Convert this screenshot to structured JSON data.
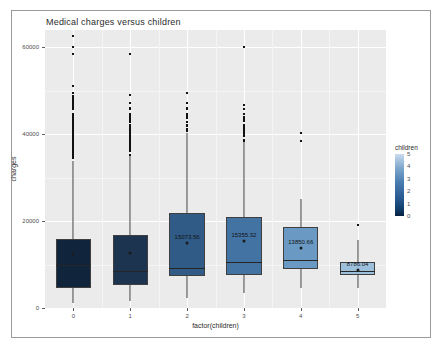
{
  "chart_data": {
    "type": "box",
    "title": "Medical charges versus children",
    "xlabel": "factor(children)",
    "ylabel": "charges",
    "categories": [
      "0",
      "1",
      "2",
      "3",
      "4",
      "5"
    ],
    "ylim": [
      0,
      64000
    ],
    "yticks": [
      "0",
      "20000",
      "40000",
      "60000"
    ],
    "ytick_values": [
      0,
      20000,
      40000,
      60000
    ],
    "grid": true,
    "legend": {
      "title": "children",
      "type": "colorbar",
      "position": "right",
      "ticks": [
        "0",
        "1",
        "2",
        "3",
        "4",
        "5"
      ],
      "tick_values": [
        0,
        1,
        2,
        3,
        4,
        5
      ],
      "low_color": "#06203f",
      "high_color": "#c9dced"
    },
    "boxes": [
      {
        "category": "0",
        "fill": "#10243c",
        "lower_whisker": 1121,
        "q1": 4600,
        "median": 9856,
        "q3": 16000,
        "upper_whisker": 33900,
        "mean": 12366,
        "label": "",
        "label_shown": false
      },
      {
        "category": "1",
        "fill": "#1c3450",
        "lower_whisker": 1711,
        "q1": 5400,
        "median": 8483,
        "q3": 16800,
        "upper_whisker": 35100,
        "mean": 12731,
        "label": "",
        "label_shown": false
      },
      {
        "category": "2",
        "fill": "#2f5b86",
        "lower_whisker": 2300,
        "q1": 7400,
        "median": 9264,
        "q3": 21900,
        "upper_whisker": 40200,
        "mean": 15073.56,
        "label": "15073.56",
        "label_shown": true
      },
      {
        "category": "3",
        "fill": "#4273a3",
        "lower_whisker": 3400,
        "q1": 7500,
        "median": 10601,
        "q3": 21000,
        "upper_whisker": 38300,
        "mean": 15355.32,
        "label": "15355.32",
        "label_shown": true
      },
      {
        "category": "4",
        "fill": "#6a9ac4",
        "lower_whisker": 4500,
        "q1": 8900,
        "median": 11034,
        "q3": 18600,
        "upper_whisker": 25200,
        "mean": 13850.66,
        "label": "13850.66",
        "label_shown": true
      },
      {
        "category": "5",
        "fill": "#9cc0dc",
        "lower_whisker": 4688,
        "q1": 7700,
        "median": 8589,
        "q3": 10600,
        "upper_whisker": 15700,
        "mean": 8786.04,
        "label": "8786.04",
        "label_shown": true
      }
    ],
    "outliers": {
      "0": [
        62592,
        60021,
        58571,
        51194,
        49577,
        48885,
        48549,
        48173,
        47928,
        47496,
        47291,
        47055,
        46889,
        46718,
        46661,
        46255,
        46200,
        45863,
        45710,
        45702,
        44585,
        44501,
        43943,
        43921,
        43813,
        43578,
        43254,
        42983,
        42856,
        42760,
        42303,
        42124,
        41999,
        41949,
        41919,
        41661,
        41097,
        40974,
        40904,
        40720,
        40419,
        40182,
        40003,
        39983,
        39774,
        39727,
        39611,
        39556,
        39241,
        38998,
        38746,
        38511,
        38282,
        38126,
        37829,
        37742,
        37701,
        37484,
        37165,
        36950,
        36910,
        36837,
        36580,
        36307,
        36085,
        35595,
        35491,
        35160,
        34806,
        34672,
        34439
      ],
      "1": [
        58571,
        48970,
        47291,
        46151,
        45863,
        45702,
        44641,
        44423,
        43943,
        43753,
        43578,
        43254,
        42983,
        42856,
        42112,
        41676,
        41097,
        40941,
        40720,
        40419,
        40182,
        39727,
        39611,
        39047,
        38746,
        38511,
        38282,
        37829,
        37701,
        37484,
        37165,
        36950,
        36580,
        36219,
        35147
      ],
      "2": [
        49577,
        47305,
        46151,
        45863,
        44641,
        44423,
        43943,
        43753,
        42856,
        42112,
        41949,
        41097,
        40720
      ],
      "3": [
        60021,
        46661,
        45863,
        44641,
        43943,
        43578,
        42983,
        42112,
        41919,
        41661,
        41097,
        40941,
        40720,
        40419,
        40182,
        39983,
        39727,
        39556,
        38746,
        38511
      ],
      "4": [
        40182,
        38511
      ],
      "5": [
        19023
      ]
    }
  }
}
